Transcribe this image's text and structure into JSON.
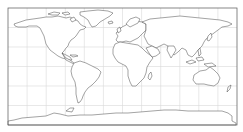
{
  "map": {
    "projection": "equirectangular",
    "frame": {
      "x": 8,
      "y": 8,
      "width": 229,
      "height": 117,
      "stroke": "#555555"
    },
    "graticule": {
      "lon_step_deg": 30,
      "lat_step_deg": 30,
      "color": "#d9d9d9"
    },
    "land_fill": "#ffffff",
    "coastline_color": "#333333",
    "regions": [
      "North America",
      "Greenland",
      "South America",
      "Europe",
      "Africa",
      "Asia",
      "Australia",
      "Antarctica"
    ]
  },
  "caption": {
    "text": ""
  }
}
